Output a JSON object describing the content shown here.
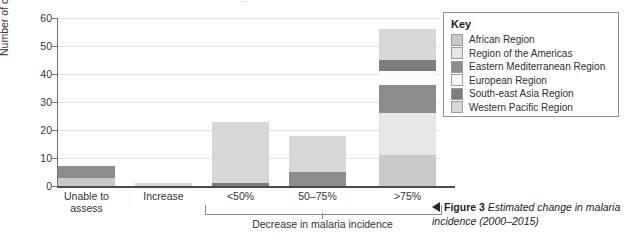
{
  "chart_data": {
    "type": "bar",
    "subtype": "stacked",
    "title": "",
    "xlabel": "Decrease in malaria incidence",
    "ylabel": "Number of countries",
    "ylim": [
      0,
      60
    ],
    "yticks": [
      0,
      10,
      20,
      30,
      40,
      50,
      60
    ],
    "grid": true,
    "legend_position": "right",
    "legend_title": "Key",
    "categories": [
      "Unable to assess",
      "Increase",
      "<50%",
      "50–75%",
      ">75%"
    ],
    "series": [
      {
        "name": "African Region",
        "color": "#c9c9c9",
        "values": [
          3,
          0,
          0,
          0,
          11
        ]
      },
      {
        "name": "Region of the Americas",
        "color": "#e6e6e6",
        "values": [
          0,
          0,
          0,
          0,
          15
        ]
      },
      {
        "name": "Eastern Mediterranean Region",
        "color": "#8c8c8c",
        "values": [
          4,
          0,
          0,
          5,
          10
        ]
      },
      {
        "name": "European Region",
        "color": "#fbfbfb",
        "values": [
          0,
          0,
          0,
          0,
          5
        ]
      },
      {
        "name": "South-east Asia Region",
        "color": "#7d7d7d",
        "values": [
          0,
          0,
          1,
          0,
          4
        ]
      },
      {
        "name": "Western Pacific Region",
        "color": "#d7d7d7",
        "values": [
          0,
          1,
          22,
          13,
          11
        ]
      }
    ],
    "totals": [
      7,
      1,
      23,
      18,
      56
    ],
    "bracket_categories": [
      "<50%",
      "50–75%",
      ">75%"
    ]
  },
  "legend": {
    "title": "Key",
    "items": [
      {
        "label": "African Region",
        "color": "#c9c9c9"
      },
      {
        "label": "Region of the Americas",
        "color": "#e6e6e6"
      },
      {
        "label": "Eastern Mediterranean Region",
        "color": "#8c8c8c"
      },
      {
        "label": "European Region",
        "color": "#fbfbfb"
      },
      {
        "label": "South-east Asia Region",
        "color": "#7d7d7d"
      },
      {
        "label": "Western Pacific Region",
        "color": "#d7d7d7"
      }
    ]
  },
  "axes": {
    "y_title": "Number of countries",
    "y_ticks": [
      "0",
      "10",
      "20",
      "30",
      "40",
      "50",
      "60"
    ],
    "x_group_label": "Decrease in malaria incidence",
    "x_labels": [
      {
        "line1": "Unable to",
        "line2": "assess"
      },
      {
        "line1": "Increase",
        "line2": ""
      },
      {
        "line1": "<50%",
        "line2": ""
      },
      {
        "line1": "50–75%",
        "line2": ""
      },
      {
        "line1": ">75%",
        "line2": ""
      }
    ]
  },
  "caption": {
    "figure_number": "Figure 3",
    "text": "Estimated change in malaria incidence (2000–2015)"
  },
  "artifacts": {
    "top_bleed": "˝˝"
  }
}
